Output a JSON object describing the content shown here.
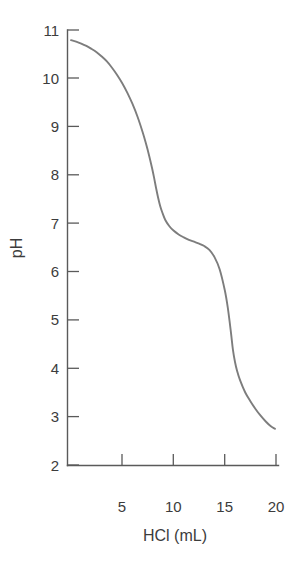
{
  "figure": {
    "background_color": "#ffffff",
    "axis_color": "#5a5a5a",
    "text_color": "#3c3c3c",
    "curve_color": "#7d7d7d"
  },
  "axes": {
    "x_title": "HCl (mL)",
    "y_title": "pH",
    "x_tick_labels": [
      "5",
      "10",
      "15",
      "20"
    ],
    "y_tick_labels": [
      "11",
      "10",
      "9",
      "8",
      "7",
      "6",
      "5",
      "4",
      "3",
      "2"
    ]
  },
  "chart_data": {
    "type": "line",
    "title": "",
    "subtitle": "",
    "xlabel": "HCl (mL)",
    "ylabel": "pH",
    "xlim": [
      0,
      20
    ],
    "ylim": [
      2,
      11
    ],
    "xticks": [
      5,
      10,
      15,
      20
    ],
    "yticks": [
      2,
      3,
      4,
      5,
      6,
      7,
      8,
      9,
      10,
      11
    ],
    "grid": false,
    "legend": null,
    "series": [
      {
        "name": "Titration of base with HCl",
        "x": [
          0.0,
          0.5,
          1.0,
          1.5,
          2.0,
          2.5,
          3.0,
          3.5,
          4.0,
          4.5,
          5.0,
          5.5,
          6.0,
          6.5,
          7.0,
          7.3,
          7.6,
          7.9,
          8.1,
          8.3,
          8.5,
          8.7,
          8.9,
          9.2,
          9.6,
          10.0,
          10.5,
          11.0,
          11.5,
          12.0,
          12.5,
          13.0,
          13.5,
          14.0,
          14.5,
          15.0,
          15.3,
          15.6,
          15.8,
          16.0,
          16.2,
          16.5,
          17.0,
          17.5,
          18.0,
          18.5,
          19.0,
          19.5,
          19.9
        ],
        "y": [
          10.79,
          10.76,
          10.72,
          10.67,
          10.61,
          10.54,
          10.45,
          10.35,
          10.22,
          10.07,
          9.9,
          9.7,
          9.47,
          9.2,
          8.88,
          8.66,
          8.42,
          8.15,
          7.95,
          7.73,
          7.53,
          7.36,
          7.23,
          7.07,
          6.94,
          6.85,
          6.77,
          6.71,
          6.66,
          6.62,
          6.58,
          6.53,
          6.45,
          6.3,
          6.05,
          5.62,
          5.25,
          4.75,
          4.38,
          4.13,
          3.95,
          3.75,
          3.5,
          3.32,
          3.16,
          3.02,
          2.9,
          2.8,
          2.75
        ]
      }
    ],
    "annotations": [
      {
        "label": "initial pH",
        "x": 0.0,
        "y": 10.79
      },
      {
        "label": "first equivalence point",
        "x": 8.4,
        "y": 7.6
      },
      {
        "label": "buffer plateau",
        "x": 12.5,
        "y": 6.58
      },
      {
        "label": "second equivalence point",
        "x": 15.7,
        "y": 4.6
      },
      {
        "label": "final pH",
        "x": 19.9,
        "y": 2.75
      }
    ]
  }
}
